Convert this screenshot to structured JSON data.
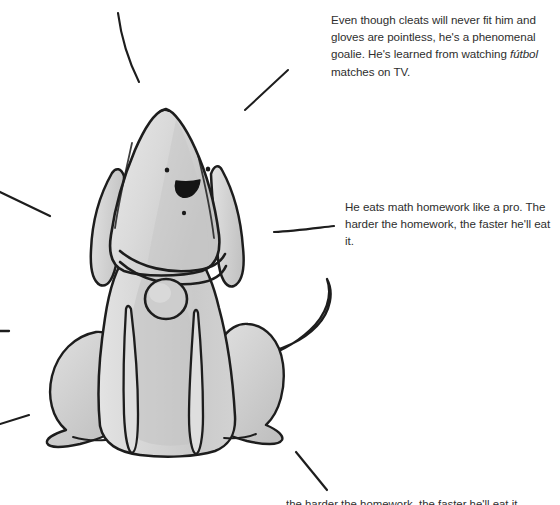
{
  "page": {
    "background_color": "#ffffff",
    "width": 560,
    "height": 505
  },
  "illustration": {
    "name": "sitting-dog-sketch",
    "description": "Hand-drawn grayscale sketch of a dog sitting upright, facing forward, with a tall pointed head, two long floppy ears, dot eyes, open smiling mouth, a small nose dot, a collar with a round hanging tag, two long front legs, haunches on either side, and a tail curling up to the right.",
    "ink_color": "#1d1d1d",
    "body_fill": "#d9d9d9",
    "shadow_fill": "#b4b4b4",
    "highlight_fill": "#eaeaea",
    "parts": [
      "head",
      "left-ear",
      "right-ear",
      "left-eye",
      "right-eye",
      "mouth",
      "nose-dot",
      "collar",
      "collar-tag",
      "body",
      "left-haunch",
      "right-haunch",
      "left-front-leg",
      "right-front-leg",
      "left-foot",
      "right-foot",
      "tail"
    ],
    "sparkle_lines": [
      {
        "name": "sparkle-top-left-curve",
        "x1": 118,
        "y1": 13,
        "x2": 139,
        "y2": 82
      },
      {
        "name": "sparkle-upper-right",
        "x1": 245,
        "y1": 110,
        "x2": 288,
        "y2": 70
      },
      {
        "name": "sparkle-left-upper",
        "x1": 0,
        "y1": 192,
        "x2": 50,
        "y2": 216
      },
      {
        "name": "sparkle-left-lower",
        "x1": 0,
        "y1": 331,
        "x2": 9,
        "y2": 331
      },
      {
        "name": "sparkle-right-middle",
        "x1": 274,
        "y1": 232,
        "x2": 334,
        "y2": 226
      },
      {
        "name": "sparkle-left-bottom",
        "x1": 0,
        "y1": 424,
        "x2": 29,
        "y2": 415
      },
      {
        "name": "sparkle-bottom-right",
        "x1": 296,
        "y1": 452,
        "x2": 327,
        "y2": 490
      }
    ]
  },
  "annotations": [
    {
      "id": "goalie",
      "text_before_italic": "Even though cleats will never fit him and gloves are pointless, he's a phenomenal goalie. He's learned from watching ",
      "italic_word": "fútbol",
      "text_after_italic": " matches on TV."
    },
    {
      "id": "homework",
      "text": "He eats math homework like a pro. The harder the homework, the faster he'll eat it."
    }
  ],
  "bottom_caption": {
    "text": "the harder the homework, the faster he'll eat it."
  }
}
